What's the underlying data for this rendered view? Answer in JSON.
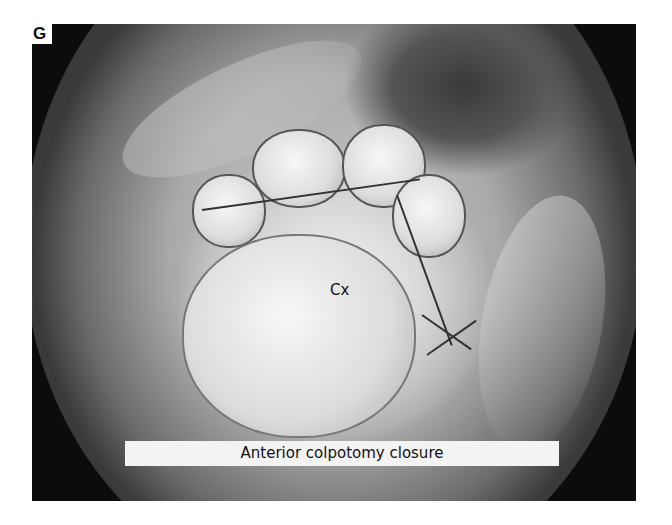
{
  "figure": {
    "panel_label": "G",
    "annotation": "Cx",
    "caption": "Anterior colpotomy closure"
  }
}
